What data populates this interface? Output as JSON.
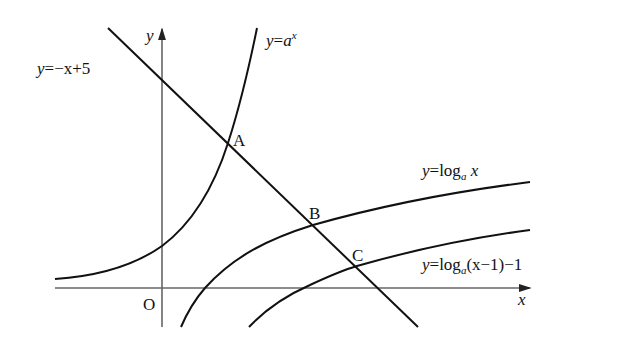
{
  "diagram": {
    "axes": {
      "x_label": "x",
      "y_label": "y",
      "origin_label": "O"
    },
    "curves": [
      {
        "id": "line",
        "equation": "y = -x + 5",
        "label_lhs": "y",
        "label_eq": "=",
        "label_rhs": "−x+5"
      },
      {
        "id": "exponential",
        "equation": "y = a^x",
        "label_lhs": "y",
        "label_eq": "=",
        "label_base": "a",
        "label_exp": "x"
      },
      {
        "id": "log",
        "equation": "y = log_a x",
        "label_lhs": "y",
        "label_eq": "=",
        "label_fn": "log",
        "label_sub": "a",
        "label_arg": "x"
      },
      {
        "id": "shifted-log",
        "equation": "y = log_a(x-1) - 1",
        "label_lhs": "y",
        "label_eq": "=",
        "label_fn": "log",
        "label_sub": "a",
        "label_arg": "(x−1)−1"
      }
    ],
    "points": [
      {
        "name": "A",
        "on": [
          "y = -x + 5",
          "y = a^x"
        ]
      },
      {
        "name": "B",
        "on": [
          "y = -x + 5",
          "y = log_a x"
        ]
      },
      {
        "name": "C",
        "on": [
          "y = -x + 5",
          "y = log_a(x-1) - 1"
        ]
      }
    ],
    "colors": {
      "stroke": "#111111",
      "axis": "#555555",
      "background": "#ffffff"
    }
  }
}
